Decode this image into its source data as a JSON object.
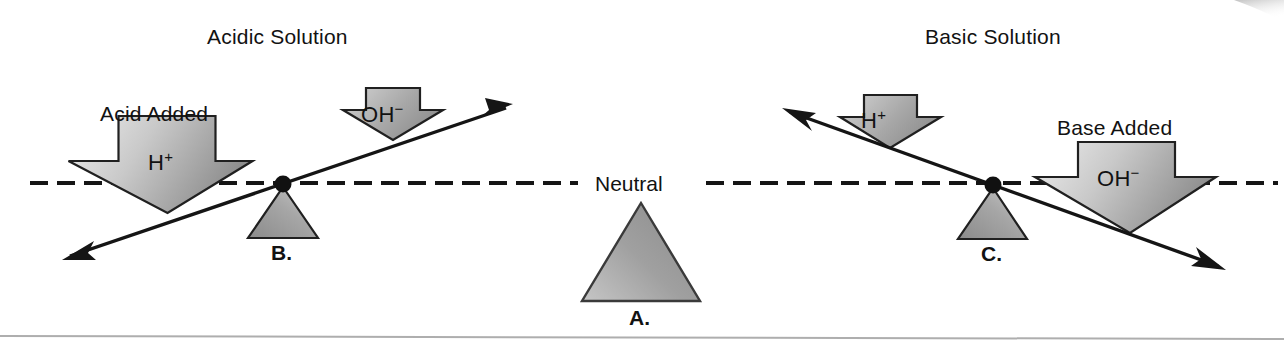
{
  "figure": {
    "width": 1284,
    "height": 351,
    "background_color": "#ffffff",
    "stroke_color": "#121212",
    "shape_fill_light": "#e6e6e6",
    "shape_fill_dark": "#8a8a8a",
    "baseline_style": "dashed",
    "baseline_label": "Neutral"
  },
  "panels": {
    "left": {
      "title": "Acidic Solution",
      "callout": "Acid Added",
      "big_arrow_ion": "H",
      "big_arrow_charge": "+",
      "small_arrow_ion": "OH",
      "small_arrow_charge": "−",
      "fulcrum_letter": "B.",
      "beam_tilt": "up-to-the-right"
    },
    "center": {
      "label": "Neutral",
      "fulcrum_letter": "A."
    },
    "right": {
      "title": "Basic Solution",
      "callout": "Base Added",
      "big_arrow_ion": "OH",
      "big_arrow_charge": "−",
      "small_arrow_ion": "H",
      "small_arrow_charge": "+",
      "fulcrum_letter": "C.",
      "beam_tilt": "down-to-the-right"
    }
  }
}
